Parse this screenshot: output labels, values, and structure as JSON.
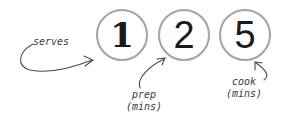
{
  "diagram": {
    "stats": [
      {
        "key": "serves",
        "value": "1"
      },
      {
        "key": "prep",
        "value": "2"
      },
      {
        "key": "cook",
        "value": "5"
      }
    ],
    "annotations": {
      "serves": "serves",
      "prep_line1": "prep",
      "prep_line2": "(mins)",
      "cook_line1": "cook",
      "cook_line2": "(mins)"
    },
    "colors": {
      "circle_stroke": "#a3a3a3",
      "digit": "#1a1a1a",
      "annotation": "#3a3a3a",
      "background": "#ffffff"
    }
  }
}
